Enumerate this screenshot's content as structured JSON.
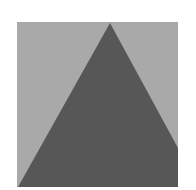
{
  "figure": {
    "background_color": "#ffffff",
    "square": {
      "x": 17,
      "y": 22,
      "width": 161,
      "height": 165,
      "color": "#a9a9a9"
    },
    "triangle": {
      "color": "#575757",
      "points": "110,23 178,148 178,187 18,187"
    }
  }
}
